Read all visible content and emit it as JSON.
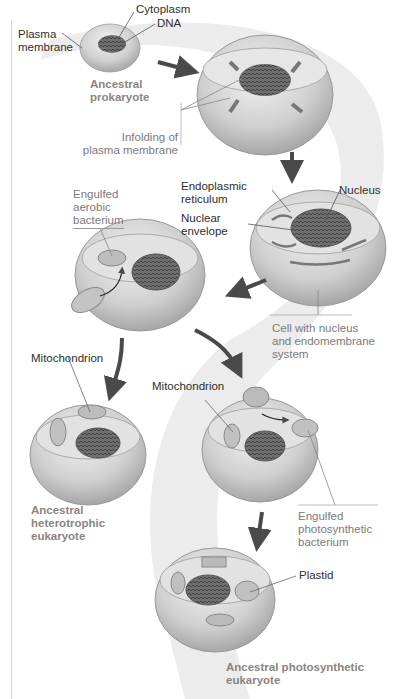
{
  "diagram": {
    "stages": [
      {
        "id": "prokaryote",
        "name": "Ancestral prokaryote"
      },
      {
        "id": "infolding",
        "name": "Infolding of plasma membrane"
      },
      {
        "id": "endomembrane",
        "name": "Cell with nucleus and endomembrane system"
      },
      {
        "id": "aerobic",
        "name": "Engulfed aerobic bacterium"
      },
      {
        "id": "heterotroph",
        "name": "Ancestral heterotrophic eukaryote"
      },
      {
        "id": "photosynthetic-engulf",
        "name": "Engulfed photosynthetic bacterium"
      },
      {
        "id": "photosynthetic",
        "name": "Ancestral photosynthetic eukaryote"
      }
    ]
  },
  "labels": {
    "cytoplasm": "Cytoplasm",
    "dna": "DNA",
    "plasma_membrane_1": "Plasma",
    "plasma_membrane_2": "membrane",
    "ancestral_prokaryote_1": "Ancestral",
    "ancestral_prokaryote_2": "prokaryote",
    "infolding_1": "Infolding of",
    "infolding_2": "plasma membrane",
    "er_1": "Endoplasmic",
    "er_2": "reticulum",
    "nucleus": "Nucleus",
    "nuclear_env_1": "Nuclear",
    "nuclear_env_2": "envelope",
    "engulfed_aerobic_1": "Engulfed",
    "engulfed_aerobic_2": "aerobic",
    "engulfed_aerobic_3": "bacterium",
    "cell_nucleus_1": "Cell with nucleus",
    "cell_nucleus_2": "and endomembrane",
    "cell_nucleus_3": "system",
    "mito_left": "Mitochondrion",
    "mito_right": "Mitochondrion",
    "heterotroph_1": "Ancestral",
    "heterotroph_2": "heterotrophic",
    "heterotroph_3": "eukaryote",
    "engulfed_photo_1": "Engulfed",
    "engulfed_photo_2": "photosynthetic",
    "engulfed_photo_3": "bacterium",
    "plastid": "Plastid",
    "photosynthetic_1": "Ancestral photosynthetic",
    "photosynthetic_2": "eukaryote"
  },
  "colors": {
    "flow_band": "#ececec",
    "arrow": "#4a4a4a",
    "cell_fill": "#c9c9c9",
    "stage_label": "#8a8580"
  }
}
